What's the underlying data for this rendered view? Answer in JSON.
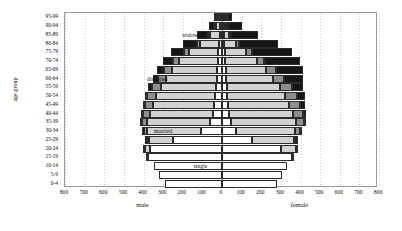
{
  "chart_data": {
    "type": "bar",
    "subtype": "population-pyramid-stacked",
    "title": "",
    "xlabel": "",
    "ylabel": "age group",
    "side_labels": {
      "left": "male",
      "right": "female"
    },
    "categories": [
      "0-4",
      "5-9",
      "10-14",
      "15-19",
      "20-24",
      "25-29",
      "30-34",
      "35-39",
      "40-44",
      "45-49",
      "50-54",
      "55-59",
      "60-64",
      "65-69",
      "70-74",
      "75-79",
      "80-84",
      "85-89",
      "90-94",
      "95-99"
    ],
    "xticks": [
      800,
      700,
      600,
      500,
      400,
      300,
      200,
      100,
      0,
      100,
      200,
      300,
      400,
      500,
      600,
      700,
      800
    ],
    "xlim": [
      -800,
      800
    ],
    "grid": true,
    "legend_position": "in-plot-annotations",
    "legend_entries": [
      "single",
      "married",
      "divorced",
      "widowed"
    ],
    "colors": {
      "single": "#ffffff",
      "married": "#d2d2d2",
      "divorced": "#8e8e8e",
      "widowed": "#161616",
      "outline": "#2b2b2b",
      "frame": "#9a9a9a",
      "grid": "#c9c9c9",
      "zero_axis": "#7d7d7d"
    },
    "annotations": [
      {
        "text": "widowed",
        "age_group": "85-89",
        "side": "male",
        "value": 150
      },
      {
        "text": "divorced",
        "age_group": "60-64",
        "side": "male",
        "value": 330
      },
      {
        "text": "married",
        "age_group": "30-34",
        "side": "male",
        "value": 300
      },
      {
        "text": "single",
        "age_group": "10-14",
        "side": "male",
        "value": 110
      }
    ],
    "series": [
      {
        "name": "single",
        "male": [
          290,
          320,
          345,
          375,
          365,
          250,
          105,
          60,
          45,
          40,
          35,
          32,
          28,
          25,
          22,
          18,
          14,
          9,
          5,
          2
        ],
        "female": [
          278,
          305,
          330,
          358,
          300,
          155,
          70,
          45,
          35,
          30,
          28,
          25,
          22,
          20,
          16,
          13,
          10,
          6,
          3,
          1
        ]
      },
      {
        "name": "married",
        "male": [
          0,
          0,
          0,
          2,
          28,
          120,
          275,
          320,
          320,
          310,
          300,
          280,
          255,
          230,
          195,
          150,
          100,
          50,
          18,
          5
        ],
        "female": [
          0,
          0,
          0,
          6,
          75,
          210,
          300,
          330,
          325,
          312,
          295,
          270,
          240,
          205,
          160,
          110,
          62,
          25,
          8,
          2
        ]
      },
      {
        "name": "divorced",
        "male": [
          0,
          0,
          0,
          0,
          1,
          6,
          18,
          30,
          38,
          42,
          45,
          46,
          44,
          40,
          33,
          24,
          15,
          7,
          2,
          1
        ],
        "female": [
          0,
          0,
          0,
          0,
          3,
          12,
          28,
          42,
          52,
          58,
          60,
          60,
          56,
          50,
          40,
          28,
          17,
          8,
          3,
          1
        ]
      },
      {
        "name": "widowed",
        "male": [
          0,
          0,
          0,
          0,
          0,
          1,
          2,
          4,
          6,
          9,
          13,
          18,
          26,
          38,
          52,
          66,
          72,
          58,
          30,
          10
        ],
        "female": [
          0,
          0,
          0,
          0,
          0,
          2,
          5,
          9,
          15,
          24,
          38,
          60,
          95,
          140,
          180,
          205,
          195,
          140,
          70,
          22
        ]
      }
    ]
  }
}
